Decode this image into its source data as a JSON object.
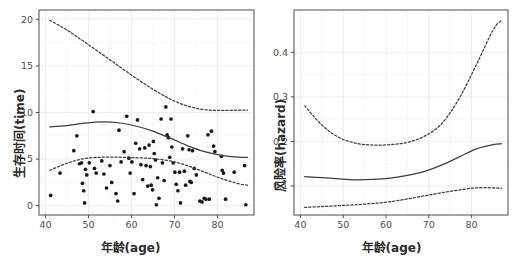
{
  "figure": {
    "width": 522,
    "height": 259,
    "background": "#ffffff",
    "panel_border_color": "#4d4d4d",
    "grid_color": "#ebebeb",
    "curve_color": "#3d3d3d",
    "point_color": "#1a1a1a",
    "tick_label_color": "#4d4d4d",
    "axis_title_color": "#2b2b2b"
  },
  "panels": {
    "left": {
      "xlabel": "年龄(age)",
      "ylabel": "生存时间(time)",
      "xticks": [
        40,
        50,
        60,
        70,
        80
      ],
      "xtick_labels": [
        "40",
        "50",
        "60",
        "70",
        "80"
      ],
      "yticks": [
        0,
        5,
        10,
        15,
        20
      ],
      "ytick_labels": [
        "0",
        "5",
        "10",
        "15",
        "20"
      ],
      "xlim": [
        38.5,
        88.5
      ],
      "ylim": [
        -1.0,
        21.0
      ]
    },
    "right": {
      "xlabel": "年龄(age)",
      "ylabel": "风险率(hazard)",
      "xticks": [
        40,
        50,
        60,
        70,
        80
      ],
      "xtick_labels": [
        "40",
        "50",
        "60",
        "70",
        "80"
      ],
      "yticks": [
        0.1,
        0.2,
        0.3,
        0.4
      ],
      "ytick_labels": [
        "0.1",
        "0.2",
        "0.3",
        "0.4"
      ],
      "xlim": [
        38.5,
        88.5
      ],
      "ylim": [
        0.035,
        0.495
      ]
    }
  },
  "chart_data": [
    {
      "type": "scatter",
      "title": "",
      "xlabel": "年龄(age)",
      "ylabel": "生存时间(time)",
      "xlim": [
        38.5,
        88.5
      ],
      "ylim": [
        -1.0,
        21.0
      ],
      "grid": true,
      "legend": "none",
      "series": [
        {
          "name": "observations",
          "style": "points",
          "points": [
            [
              41.2,
              1.1
            ],
            [
              43.4,
              3.5
            ],
            [
              46.6,
              5.9
            ],
            [
              47.3,
              7.5
            ],
            [
              47.9,
              4.5
            ],
            [
              48.4,
              4.6
            ],
            [
              48.6,
              2.4
            ],
            [
              48.9,
              1.6
            ],
            [
              49.1,
              0.3
            ],
            [
              49.3,
              3.9
            ],
            [
              49.6,
              3.3
            ],
            [
              50.2,
              4.6
            ],
            [
              51.1,
              10.1
            ],
            [
              51.4,
              4.0
            ],
            [
              51.8,
              3.5
            ],
            [
              53.1,
              4.8
            ],
            [
              53.6,
              3.4
            ],
            [
              54.2,
              1.9
            ],
            [
              55.0,
              4.3
            ],
            [
              55.4,
              2.5
            ],
            [
              56.4,
              1.3
            ],
            [
              56.8,
              0.5
            ],
            [
              57.1,
              8.1
            ],
            [
              57.6,
              4.7
            ],
            [
              58.3,
              5.8
            ],
            [
              58.9,
              9.6
            ],
            [
              59.4,
              5.1
            ],
            [
              59.7,
              3.5
            ],
            [
              60.1,
              4.7
            ],
            [
              60.6,
              1.3
            ],
            [
              61.0,
              6.7
            ],
            [
              61.4,
              9.2
            ],
            [
              61.9,
              6.1
            ],
            [
              62.2,
              4.4
            ],
            [
              62.6,
              2.8
            ],
            [
              63.1,
              6.2
            ],
            [
              63.4,
              4.3
            ],
            [
              63.8,
              2.1
            ],
            [
              64.1,
              6.5
            ],
            [
              64.4,
              4.2
            ],
            [
              64.6,
              2.2
            ],
            [
              64.9,
              1.7
            ],
            [
              65.1,
              6.9
            ],
            [
              65.3,
              5.6
            ],
            [
              65.6,
              4.9
            ],
            [
              65.8,
              0.1
            ],
            [
              66.1,
              3.0
            ],
            [
              66.4,
              0.8
            ],
            [
              66.9,
              9.3
            ],
            [
              67.2,
              4.6
            ],
            [
              67.6,
              2.7
            ],
            [
              68.0,
              10.6
            ],
            [
              68.3,
              7.6
            ],
            [
              68.6,
              7.3
            ],
            [
              68.9,
              5.2
            ],
            [
              69.2,
              9.3
            ],
            [
              69.4,
              6.3
            ],
            [
              69.7,
              4.6
            ],
            [
              70.1,
              3.6
            ],
            [
              70.4,
              2.3
            ],
            [
              70.8,
              1.6
            ],
            [
              71.2,
              3.6
            ],
            [
              71.4,
              0.3
            ],
            [
              71.9,
              6.1
            ],
            [
              72.3,
              3.7
            ],
            [
              72.6,
              2.2
            ],
            [
              73.1,
              7.5
            ],
            [
              73.4,
              6.0
            ],
            [
              73.6,
              2.6
            ],
            [
              73.9,
              2.5
            ],
            [
              74.2,
              5.9
            ],
            [
              74.6,
              4.0
            ],
            [
              75.1,
              3.3
            ],
            [
              75.9,
              0.5
            ],
            [
              76.4,
              0.4
            ],
            [
              76.9,
              0.8
            ],
            [
              77.3,
              0.7
            ],
            [
              77.8,
              7.6
            ],
            [
              78.1,
              0.7
            ],
            [
              78.6,
              8.0
            ],
            [
              79.1,
              6.4
            ],
            [
              79.4,
              5.8
            ],
            [
              80.9,
              5.3
            ],
            [
              81.1,
              3.8
            ],
            [
              81.4,
              3.5
            ],
            [
              81.9,
              0.7
            ],
            [
              83.9,
              3.6
            ],
            [
              86.3,
              4.3
            ],
            [
              86.6,
              0.1
            ]
          ]
        },
        {
          "name": "fitted-mean",
          "style": "solid-line",
          "x": [
            41.0,
            45.0,
            49.0,
            53.0,
            57.0,
            61.0,
            65.0,
            69.0,
            73.0,
            77.0,
            81.0,
            85.0,
            87.0
          ],
          "y": [
            8.45,
            8.6,
            8.85,
            9.0,
            8.9,
            8.55,
            8.0,
            7.25,
            6.45,
            5.8,
            5.4,
            5.2,
            5.18
          ]
        },
        {
          "name": "upper-confidence-band",
          "style": "dashed-line",
          "x": [
            41.0,
            45.0,
            49.0,
            53.0,
            57.0,
            61.0,
            65.0,
            69.0,
            73.0,
            77.0,
            81.0,
            85.0,
            87.0
          ],
          "y": [
            19.9,
            18.85,
            17.6,
            16.3,
            15.0,
            13.7,
            12.5,
            11.45,
            10.7,
            10.3,
            10.22,
            10.25,
            10.25
          ]
        },
        {
          "name": "lower-confidence-band",
          "style": "dashed-line",
          "x": [
            41.0,
            45.0,
            49.0,
            53.0,
            57.0,
            61.0,
            65.0,
            69.0,
            73.0,
            77.0,
            81.0,
            85.0,
            87.0
          ],
          "y": [
            3.8,
            4.55,
            5.05,
            5.2,
            5.2,
            5.15,
            5.05,
            4.8,
            4.3,
            3.6,
            2.9,
            2.35,
            2.2
          ]
        }
      ]
    },
    {
      "type": "line",
      "title": "",
      "xlabel": "年龄(age)",
      "ylabel": "风险率(hazard)",
      "xlim": [
        38.5,
        88.5
      ],
      "ylim": [
        0.035,
        0.495
      ],
      "grid": true,
      "legend": "none",
      "series": [
        {
          "name": "hazard-estimate",
          "style": "solid-line",
          "x": [
            41.0,
            45.0,
            49.0,
            53.0,
            57.0,
            61.0,
            65.0,
            69.0,
            73.0,
            77.0,
            81.0,
            85.0,
            87.0
          ],
          "y": [
            0.121,
            0.119,
            0.116,
            0.114,
            0.115,
            0.118,
            0.124,
            0.133,
            0.147,
            0.165,
            0.183,
            0.193,
            0.195
          ]
        },
        {
          "name": "upper-confidence-band",
          "style": "dashed-line",
          "x": [
            41.0,
            45.0,
            49.0,
            53.0,
            57.0,
            61.0,
            65.0,
            69.0,
            73.0,
            77.0,
            81.0,
            85.0,
            87.0
          ],
          "y": [
            0.28,
            0.237,
            0.209,
            0.196,
            0.192,
            0.193,
            0.198,
            0.212,
            0.24,
            0.295,
            0.37,
            0.45,
            0.472
          ]
        },
        {
          "name": "lower-confidence-band",
          "style": "dashed-line",
          "x": [
            41.0,
            45.0,
            49.0,
            53.0,
            57.0,
            61.0,
            65.0,
            69.0,
            73.0,
            77.0,
            81.0,
            85.0,
            87.0
          ],
          "y": [
            0.052,
            0.054,
            0.056,
            0.058,
            0.061,
            0.065,
            0.071,
            0.078,
            0.085,
            0.091,
            0.096,
            0.096,
            0.095
          ]
        }
      ]
    }
  ]
}
